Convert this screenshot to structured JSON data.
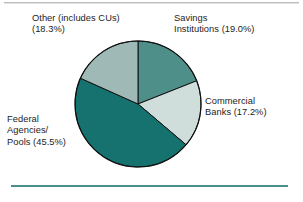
{
  "figure": {
    "background_color": "#ffffff",
    "top_rule_color": "#bcbcbc",
    "bottom_rule_color": "#4a8f8b"
  },
  "chart_data": {
    "type": "pie",
    "title": "",
    "subtitle": "",
    "xlabel": "",
    "ylabel": "",
    "legend_position": "none",
    "grid": false,
    "units": "percent",
    "start_angle_deg": 0,
    "direction": "clockwise",
    "categories": [
      "Savings Institutions",
      "Commercial Banks",
      "Federal Agencies/Pools",
      "Other (includes CUs)"
    ],
    "values": [
      19.0,
      17.2,
      45.5,
      18.3
    ],
    "colors": [
      "#4f8f8a",
      "#cfdedb",
      "#15726f",
      "#9fbab6"
    ],
    "slice_outline_color": "#111111",
    "slices": [
      {
        "name": "Savings Institutions",
        "value": 19.0,
        "value_label": "19.0%",
        "color": "#4f8f8a",
        "label_text": "Savings\nInstitutions (19.0%)"
      },
      {
        "name": "Commercial Banks",
        "value": 17.2,
        "value_label": "17.2%",
        "color": "#cfdedb",
        "label_text": "Commercial\nBanks (17.2%)"
      },
      {
        "name": "Federal Agencies/Pools",
        "value": 45.5,
        "value_label": "45.5%",
        "color": "#15726f",
        "label_text": "Federal\nAgencies/\nPools (45.5%)"
      },
      {
        "name": "Other (includes CUs)",
        "value": 18.3,
        "value_label": "18.3%",
        "color": "#9fbab6",
        "label_text": "Other (includes CUs)\n(18.3%)"
      }
    ]
  }
}
